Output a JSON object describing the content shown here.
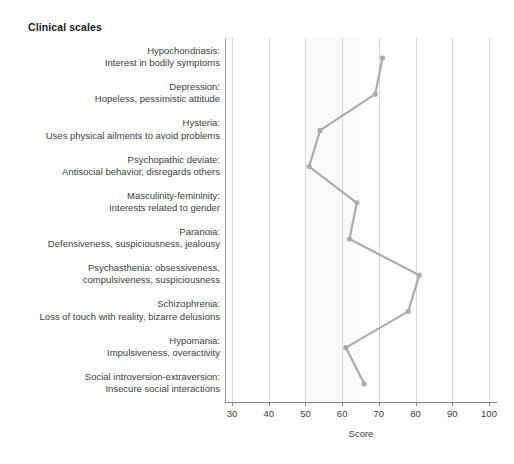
{
  "title": "Clinical scales",
  "chart_data": {
    "type": "line",
    "title": "Clinical scales",
    "xlabel": "Score",
    "ylabel": "",
    "xlim": [
      30,
      100
    ],
    "xticks": [
      30,
      40,
      50,
      60,
      70,
      80,
      90,
      100
    ],
    "xtick_labels": [
      "30",
      "40",
      "50",
      "60",
      "70",
      "80",
      "90",
      "100"
    ],
    "grid": true,
    "legend": "none",
    "orientation": "horizontal",
    "line_color": "#a9adb1",
    "marker_color": "#a9adb1",
    "normal_band": [
      50,
      65
    ],
    "categories": [
      "Hypochondriasis: Interest in bodily symptoms",
      "Depression: Hopeless, pessimistic attitude",
      "Hysteria: Uses physical ailments to avoid problems",
      "Psychopathic deviate: Antisocial behavior, disregards others",
      "Masculinity-femininity: Interests related to gender",
      "Paranoia: Defensiveness, suspiciousness, jealousy",
      "Psychasthenia: obsessiveness, compulsiveness, suspiciousness",
      "Schizophrenia: Loss of touch with reality, bizarre delusions",
      "Hypomania: Impulsiveness, overactivity",
      "Social introversion-extraversion: Insecure social interactions"
    ],
    "values": [
      71,
      69,
      54,
      51,
      64,
      62,
      81,
      78,
      61,
      66
    ]
  },
  "axis": {
    "x_label": "Score",
    "ticks": [
      {
        "value": 30,
        "label": "30"
      },
      {
        "value": 40,
        "label": "40"
      },
      {
        "value": 50,
        "label": "50"
      },
      {
        "value": 60,
        "label": "60"
      },
      {
        "value": 70,
        "label": "70"
      },
      {
        "value": 80,
        "label": "80"
      },
      {
        "value": 90,
        "label": "90"
      },
      {
        "value": 100,
        "label": "100"
      }
    ]
  },
  "scales": [
    {
      "name": "Hypochondriasis",
      "line1": "Hypochondriasis:",
      "line2": "Interest in bodily symptoms",
      "value": 71
    },
    {
      "name": "Depression",
      "line1": "Depression:",
      "line2": "Hopeless, pessimistic attitude",
      "value": 69
    },
    {
      "name": "Hysteria",
      "line1": "Hysteria:",
      "line2": "Uses physical ailments to avoid problems",
      "value": 54
    },
    {
      "name": "Psychopathic deviate",
      "line1": "Psychopathic deviate:",
      "line2": "Antisocial behavior, disregards others",
      "value": 51
    },
    {
      "name": "Masculinity-femininity",
      "line1": "Masculinity-femininity:",
      "line2": "Interests related to gender",
      "value": 64
    },
    {
      "name": "Paranoia",
      "line1": "Paranoia:",
      "line2": "Defensiveness, suspiciousness, jealousy",
      "value": 62
    },
    {
      "name": "Psychasthenia",
      "line1": "Psychasthenia: obsessiveness,",
      "line2": "compulsiveness, suspiciousness",
      "value": 81
    },
    {
      "name": "Schizophrenia",
      "line1": "Schizophrenia:",
      "line2": "Loss of touch with reality, bizarre delusions",
      "value": 78
    },
    {
      "name": "Hypomania",
      "line1": "Hypomania:",
      "line2": "Impulsiveness, overactivity",
      "value": 61
    },
    {
      "name": "Social introversion-extraversion",
      "line1": "Social introversion-extraversion:",
      "line2": "Insecure social interactions",
      "value": 66
    }
  ],
  "colors": {
    "line": "#a9adb1",
    "grid": "#d6d8da",
    "axis": "#80868b",
    "text": "#3c4043",
    "title": "#202124",
    "band": "#fafafa",
    "background": "#ffffff"
  }
}
